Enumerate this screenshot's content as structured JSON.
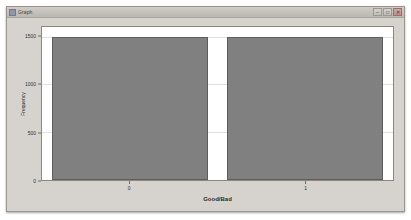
{
  "window": {
    "title": "Graph",
    "icon": "chart-icon",
    "controls": [
      {
        "name": "minimize",
        "glyph": "–"
      },
      {
        "name": "maximize",
        "glyph": "□"
      },
      {
        "name": "close",
        "glyph": "✕"
      }
    ]
  },
  "chart_data": {
    "type": "bar",
    "title": "",
    "subtitle": "",
    "xlabel": "Good/Bad",
    "ylabel": "Frequency",
    "categories": [
      "0",
      "1"
    ],
    "values": [
      1500,
      1500
    ],
    "ylim": [
      0,
      1600
    ],
    "yticks": [
      0,
      500,
      1000,
      1500
    ],
    "ytick_labels": [
      "0",
      "500",
      "1000",
      "1500"
    ],
    "grid": true,
    "legend": false,
    "bar_color": "#808080",
    "bar_edge_color": "#5d5d5d",
    "plot_background": "#ffffff",
    "panel_background": "#d6d3ce"
  }
}
